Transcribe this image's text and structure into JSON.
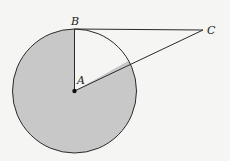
{
  "diagram": {
    "points": {
      "A": {
        "label": "A",
        "x": 74.5,
        "y": 91
      },
      "B": {
        "label": "B",
        "x": 74.5,
        "y": 29
      },
      "C": {
        "label": "C",
        "x": 203,
        "y": 30
      }
    },
    "circle": {
      "center": "A",
      "radius": 62,
      "fill": "#c8c8c8",
      "stroke": "#2a2a2a"
    },
    "segments": [
      "AB",
      "BC",
      "AC"
    ],
    "shaded_region": "circle minus sector BAC",
    "colors": {
      "background": "#f5f5f3",
      "shade": "#c8c8c8",
      "line": "#2a2a2a"
    }
  }
}
